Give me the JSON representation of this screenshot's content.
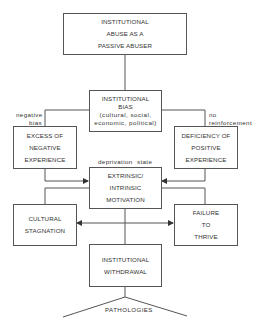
{
  "diagram": {
    "nodes": {
      "top": {
        "lines": [
          "INSTITUTIONAL",
          "ABUSE AS A",
          "PASSIVE ABUSER"
        ]
      },
      "bias": {
        "lines": [
          "INSTITUTIONAL",
          "BIAS",
          "(cultural,  social,",
          "economic,  political)"
        ]
      },
      "excess": {
        "lines": [
          "EXCESS OF",
          "NEGATIVE",
          "EXPERIENCE"
        ]
      },
      "deficiency": {
        "lines": [
          "DEFICIENCY OF",
          "POSITIVE",
          "EXPERIENCE"
        ]
      },
      "motivation": {
        "lines": [
          "EXTRINSIC/",
          "INTRINSIC",
          "MOTIVATION"
        ]
      },
      "stagnation": {
        "lines": [
          "CULTURAL",
          "STAGNATION"
        ]
      },
      "failure": {
        "lines": [
          "FAILURE",
          "TO",
          "THRIVE"
        ]
      },
      "withdrawal": {
        "lines": [
          "INSTITUTIONAL",
          "WITHDRAWAL"
        ]
      }
    },
    "edge_labels": {
      "negative_bias": [
        "negative",
        "bias"
      ],
      "no_reinforcement": [
        "no",
        "reinforcement"
      ],
      "deprivation_state": "deprivation  state",
      "pathologies": "PATHOLOGIES"
    },
    "edges": [
      {
        "from": "top",
        "to": "bias"
      },
      {
        "from": "bias",
        "to": "excess",
        "label": "negative bias"
      },
      {
        "from": "bias",
        "to": "deficiency",
        "label": "no reinforcement"
      },
      {
        "from": "excess",
        "to": "motivation",
        "arrow": true
      },
      {
        "from": "deficiency",
        "to": "motivation",
        "arrow": true
      },
      {
        "from": "motivation",
        "to": "stagnation"
      },
      {
        "from": "motivation",
        "to": "failure"
      },
      {
        "from": "stagnation",
        "to": "failure",
        "arrow": "both"
      },
      {
        "from": "withdrawal",
        "to": "pathologies"
      }
    ]
  }
}
